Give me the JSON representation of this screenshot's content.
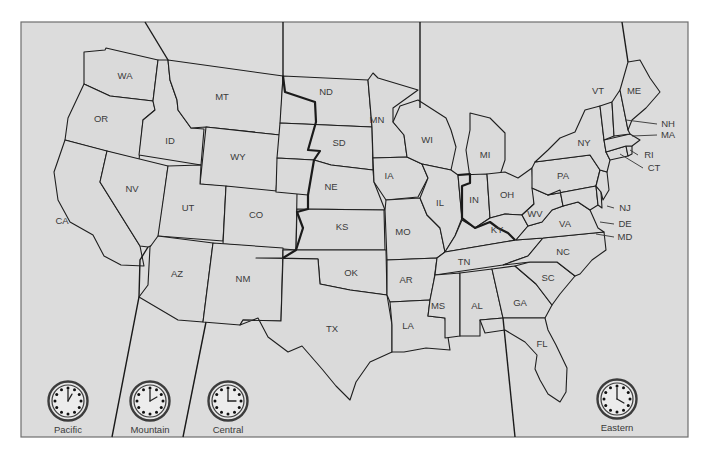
{
  "map": {
    "title": "United States Time Zones",
    "colors": {
      "land": "#dadada",
      "frame": "#dcdcdc",
      "border": "#1e1e1e",
      "label": "#3a3a3a"
    },
    "states": [
      {
        "abbr": "WA",
        "x": 125,
        "y": 76
      },
      {
        "abbr": "OR",
        "x": 101,
        "y": 119
      },
      {
        "abbr": "CA",
        "x": 62,
        "y": 221
      },
      {
        "abbr": "NV",
        "x": 132,
        "y": 189
      },
      {
        "abbr": "ID",
        "x": 170,
        "y": 141
      },
      {
        "abbr": "MT",
        "x": 222,
        "y": 97
      },
      {
        "abbr": "WY",
        "x": 238,
        "y": 157
      },
      {
        "abbr": "UT",
        "x": 188,
        "y": 208
      },
      {
        "abbr": "CO",
        "x": 256,
        "y": 215
      },
      {
        "abbr": "AZ",
        "x": 177,
        "y": 274
      },
      {
        "abbr": "NM",
        "x": 243,
        "y": 279
      },
      {
        "abbr": "ND",
        "x": 326,
        "y": 92
      },
      {
        "abbr": "SD",
        "x": 339,
        "y": 143
      },
      {
        "abbr": "NE",
        "x": 331,
        "y": 187
      },
      {
        "abbr": "KS",
        "x": 342,
        "y": 227
      },
      {
        "abbr": "OK",
        "x": 351,
        "y": 273
      },
      {
        "abbr": "TX",
        "x": 332,
        "y": 329
      },
      {
        "abbr": "MN",
        "x": 377,
        "y": 120
      },
      {
        "abbr": "IA",
        "x": 389,
        "y": 176
      },
      {
        "abbr": "MO",
        "x": 403,
        "y": 232
      },
      {
        "abbr": "AR",
        "x": 406,
        "y": 280
      },
      {
        "abbr": "LA",
        "x": 408,
        "y": 326
      },
      {
        "abbr": "WI",
        "x": 427,
        "y": 140
      },
      {
        "abbr": "IL",
        "x": 440,
        "y": 203
      },
      {
        "abbr": "MI",
        "x": 485,
        "y": 155
      },
      {
        "abbr": "IN",
        "x": 474,
        "y": 200
      },
      {
        "abbr": "OH",
        "x": 507,
        "y": 195
      },
      {
        "abbr": "KY",
        "x": 497,
        "y": 230
      },
      {
        "abbr": "TN",
        "x": 464,
        "y": 262
      },
      {
        "abbr": "MS",
        "x": 438,
        "y": 306
      },
      {
        "abbr": "AL",
        "x": 477,
        "y": 306
      },
      {
        "abbr": "GA",
        "x": 520,
        "y": 303
      },
      {
        "abbr": "FL",
        "x": 542,
        "y": 344
      },
      {
        "abbr": "SC",
        "x": 548,
        "y": 278
      },
      {
        "abbr": "NC",
        "x": 563,
        "y": 252
      },
      {
        "abbr": "VA",
        "x": 565,
        "y": 224
      },
      {
        "abbr": "WV",
        "x": 535,
        "y": 214
      },
      {
        "abbr": "PA",
        "x": 563,
        "y": 176
      },
      {
        "abbr": "NY",
        "x": 584,
        "y": 143
      },
      {
        "abbr": "VT",
        "x": 598,
        "y": 91
      },
      {
        "abbr": "ME",
        "x": 634,
        "y": 91
      }
    ],
    "callouts": [
      {
        "abbr": "NH",
        "x": 665,
        "y": 124
      },
      {
        "abbr": "MA",
        "x": 665,
        "y": 135
      },
      {
        "abbr": "RI",
        "x": 646,
        "y": 155
      },
      {
        "abbr": "CT",
        "x": 651,
        "y": 168
      },
      {
        "abbr": "NJ",
        "x": 622,
        "y": 208
      },
      {
        "abbr": "DE",
        "x": 622,
        "y": 224
      },
      {
        "abbr": "MD",
        "x": 622,
        "y": 237
      }
    ],
    "time_zones": [
      {
        "name": "Pacific",
        "clock_x": 68,
        "clock_y": 401,
        "hour": 1,
        "minute": 0
      },
      {
        "name": "Mountain",
        "clock_x": 150,
        "clock_y": 401,
        "hour": 2,
        "minute": 0
      },
      {
        "name": "Central",
        "clock_x": 228,
        "clock_y": 401,
        "hour": 3,
        "minute": 0
      },
      {
        "name": "Eastern",
        "clock_x": 617,
        "clock_y": 399,
        "hour": 4,
        "minute": 0
      }
    ]
  }
}
